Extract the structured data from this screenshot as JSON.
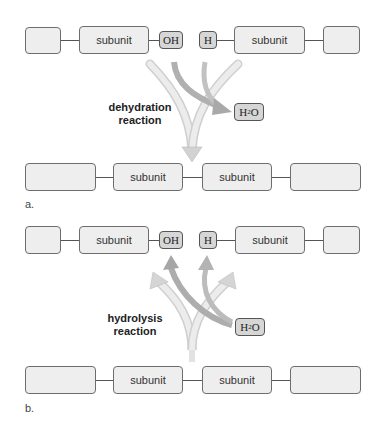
{
  "panel_a": {
    "label": "a.",
    "reaction_label_line1": "dehydration",
    "reaction_label_line2": "reaction",
    "top_chain": {
      "subunit_left": "subunit",
      "hydroxyl": "OH",
      "hydrogen": "H",
      "subunit_right": "subunit"
    },
    "water": {
      "main": "H",
      "sub": "2",
      "end": "O"
    },
    "bottom_chain": {
      "subunit_left": "subunit",
      "subunit_right": "subunit"
    }
  },
  "panel_b": {
    "label": "b.",
    "reaction_label_line1": "hydrolysis",
    "reaction_label_line2": "reaction",
    "top_chain": {
      "subunit_left": "subunit",
      "hydroxyl": "OH",
      "hydrogen": "H",
      "subunit_right": "subunit"
    },
    "water": {
      "main": "H",
      "sub": "2",
      "end": "O"
    },
    "bottom_chain": {
      "subunit_left": "subunit",
      "subunit_right": "subunit"
    }
  },
  "colors": {
    "box_fill": "#eeeeee",
    "chem_fill": "#d6d6d6",
    "arrow_light": "#dcdcdc",
    "arrow_dark": "#b5b5b5"
  }
}
